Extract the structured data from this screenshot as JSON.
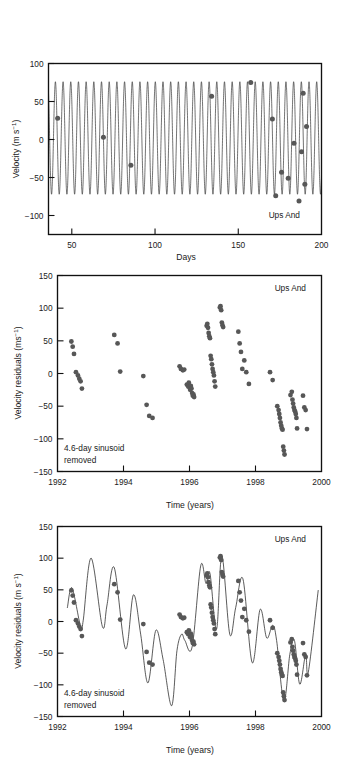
{
  "figure": {
    "object_label": "Ups And",
    "annotation_line1": "4.6-day sinusoid",
    "annotation_line2": "removed",
    "point_color": "#575757",
    "curve_color": "#1b1b1b",
    "axis_color": "#111111"
  },
  "panels": [
    {
      "id": "panel-1",
      "object_label": "Ups And",
      "ylabel_main": "Velocity (m s",
      "ylabel_sup": "−1",
      "ylabel_tail": ")",
      "xlabel": "Days",
      "ytick_labels": [
        "100",
        "50",
        "0",
        "−50",
        "−100"
      ],
      "xtick_labels": [
        "50",
        "100",
        "150",
        "200"
      ]
    },
    {
      "id": "panel-2",
      "object_label": "Ups And",
      "ylabel_main": "Velocity residuals (ms",
      "ylabel_sup": "−1",
      "ylabel_tail": ")",
      "xlabel": "Time (years)",
      "annotation_line1": "4.6-day sinusoid",
      "annotation_line2": "removed",
      "ytick_labels": [
        "150",
        "100",
        "50",
        "0",
        "−50",
        "−100",
        "−150"
      ],
      "xtick_labels": [
        "1992",
        "1994",
        "1996",
        "1998",
        "2000"
      ]
    },
    {
      "id": "panel-3",
      "object_label": "Ups And",
      "ylabel_main": "Velocity residuals (m s",
      "ylabel_sup": "−1",
      "ylabel_tail": ")",
      "xlabel": "Time (years)",
      "annotation_line1": "4.6-day sinusoid",
      "annotation_line2": "removed",
      "ytick_labels": [
        "150",
        "100",
        "50",
        "0",
        "−50",
        "−100",
        "−150"
      ],
      "xtick_labels": [
        "1992",
        "1994",
        "1996",
        "1998",
        "2000"
      ]
    }
  ],
  "chart_data": [
    {
      "type": "line",
      "title": "Ups And",
      "xlabel": "Days",
      "ylabel": "Velocity (m s^-1)",
      "xlim": [
        36,
        200
      ],
      "ylim": [
        -125,
        100
      ],
      "xticks": [
        50,
        100,
        150,
        200
      ],
      "yticks": [
        100,
        50,
        0,
        -50,
        -100
      ],
      "grid": false,
      "legend": false,
      "annotation": "Ups And",
      "model": {
        "name": "4.6-day sinusoid",
        "period_days": 4.617,
        "amplitude": 74,
        "offset": 2,
        "phase_deg": 200
      },
      "series": [
        {
          "name": "Radial velocity measurements",
          "marker": "circle",
          "x": [
            41.5,
            69.0,
            85.5,
            134.0,
            157.5,
            170.5,
            172.5,
            176.0,
            180.0,
            183.5,
            186.5,
            188.0,
            189.0,
            190.0,
            191.0
          ],
          "y": [
            28,
            3,
            -34,
            57,
            75,
            27,
            -74,
            -43,
            -51,
            -5,
            -81,
            -16,
            61,
            -59,
            17
          ]
        }
      ]
    },
    {
      "type": "scatter",
      "title": "Ups And",
      "xlabel": "Time (years)",
      "ylabel": "Velocity residuals (ms^-1)",
      "xlim": [
        1992.0,
        2000.0
      ],
      "ylim": [
        -150,
        150
      ],
      "xticks": [
        1992,
        1994,
        1996,
        1998,
        2000
      ],
      "yticks": [
        150,
        100,
        50,
        0,
        -50,
        -100,
        -150
      ],
      "grid": false,
      "legend": false,
      "annotation": "4.6-day sinusoid removed",
      "series": [
        {
          "name": "Velocity residuals",
          "marker": "circle",
          "x": [
            1992.42,
            1992.46,
            1992.5,
            1992.62,
            1992.66,
            1992.7,
            1992.74,
            1992.56,
            1993.72,
            1993.82,
            1993.9,
            1994.6,
            1994.7,
            1994.78,
            1994.88,
            1995.7,
            1995.74,
            1995.8,
            1995.84,
            1995.92,
            1995.96,
            1995.98,
            1996.0,
            1996.02,
            1996.04,
            1996.06,
            1996.08,
            1996.1,
            1996.12,
            1996.14,
            1996.52,
            1996.54,
            1996.56,
            1996.58,
            1996.6,
            1996.62,
            1996.64,
            1996.66,
            1996.68,
            1996.7,
            1996.72,
            1996.74,
            1996.76,
            1996.78,
            1996.92,
            1996.94,
            1996.96,
            1996.98,
            1997.0,
            1997.02,
            1997.48,
            1997.52,
            1997.56,
            1997.6,
            1997.66,
            1997.72,
            1997.8,
            1998.44,
            1998.52,
            1998.66,
            1998.7,
            1998.72,
            1998.74,
            1998.76,
            1998.78,
            1998.8,
            1998.82,
            1998.84,
            1998.86,
            1998.88,
            1999.06,
            1999.1,
            1999.12,
            1999.14,
            1999.16,
            1999.18,
            1999.2,
            1999.22,
            1999.24,
            1999.26,
            1999.44,
            1999.48,
            1999.52,
            1999.56
          ],
          "y": [
            49,
            41,
            30,
            -3,
            -8,
            -12,
            -23,
            2,
            59,
            46,
            3,
            -4,
            -48,
            -65,
            -68,
            11,
            7,
            5,
            6,
            -17,
            -20,
            -14,
            -21,
            -25,
            -19,
            -23,
            -30,
            -34,
            -32,
            -36,
            73,
            76,
            70,
            62,
            57,
            54,
            27,
            22,
            14,
            7,
            2,
            -3,
            -12,
            -20,
            101,
            103,
            97,
            78,
            74,
            71,
            64,
            46,
            33,
            7,
            20,
            2,
            -16,
            2,
            -10,
            -50,
            -56,
            -62,
            -68,
            -75,
            -80,
            -84,
            -86,
            -112,
            -118,
            -124,
            -33,
            -28,
            -40,
            -46,
            -52,
            -56,
            -58,
            -62,
            -68,
            -84,
            -34,
            -52,
            -56,
            -85
          ]
        }
      ]
    },
    {
      "type": "line",
      "title": "Ups And",
      "xlabel": "Time (years)",
      "ylabel": "Velocity residuals (m s^-1)",
      "xlim": [
        1992.0,
        2000.0
      ],
      "ylim": [
        -150,
        150
      ],
      "xticks": [
        1992,
        1994,
        1996,
        1998,
        2000
      ],
      "yticks": [
        150,
        100,
        50,
        0,
        -50,
        -100,
        -150
      ],
      "grid": false,
      "legend": false,
      "annotation": "4.6-day sinusoid removed",
      "model": {
        "name": "Two-companion Keplerian fit",
        "components": [
          {
            "period_years": 0.66,
            "amplitude": 55,
            "phase_deg": 40
          },
          {
            "period_years": 3.5,
            "amplitude": 48,
            "phase_deg": 150
          }
        ]
      },
      "series": [
        {
          "name": "Velocity residuals",
          "marker": "circle",
          "x": [
            1992.42,
            1992.46,
            1992.5,
            1992.62,
            1992.66,
            1992.7,
            1992.74,
            1992.56,
            1993.72,
            1993.82,
            1993.9,
            1994.6,
            1994.7,
            1994.78,
            1994.88,
            1995.7,
            1995.74,
            1995.8,
            1995.84,
            1995.92,
            1995.96,
            1995.98,
            1996.0,
            1996.02,
            1996.04,
            1996.06,
            1996.08,
            1996.1,
            1996.12,
            1996.14,
            1996.52,
            1996.54,
            1996.56,
            1996.58,
            1996.6,
            1996.62,
            1996.64,
            1996.66,
            1996.68,
            1996.7,
            1996.72,
            1996.74,
            1996.76,
            1996.78,
            1996.92,
            1996.94,
            1996.96,
            1996.98,
            1997.0,
            1997.02,
            1997.48,
            1997.52,
            1997.56,
            1997.6,
            1997.66,
            1997.72,
            1997.8,
            1998.44,
            1998.52,
            1998.66,
            1998.7,
            1998.72,
            1998.74,
            1998.76,
            1998.78,
            1998.8,
            1998.82,
            1998.84,
            1998.86,
            1998.88,
            1999.06,
            1999.1,
            1999.12,
            1999.14,
            1999.16,
            1999.18,
            1999.2,
            1999.22,
            1999.24,
            1999.26,
            1999.44,
            1999.48,
            1999.52,
            1999.56
          ],
          "y": [
            49,
            41,
            30,
            -3,
            -8,
            -12,
            -23,
            2,
            59,
            46,
            3,
            -4,
            -48,
            -65,
            -68,
            11,
            7,
            5,
            6,
            -17,
            -20,
            -14,
            -21,
            -25,
            -19,
            -23,
            -30,
            -34,
            -32,
            -36,
            73,
            76,
            70,
            62,
            57,
            54,
            27,
            22,
            14,
            7,
            2,
            -3,
            -12,
            -20,
            101,
            103,
            97,
            78,
            74,
            71,
            64,
            46,
            33,
            7,
            20,
            2,
            -16,
            2,
            -10,
            -50,
            -56,
            -62,
            -68,
            -75,
            -80,
            -84,
            -86,
            -112,
            -118,
            -124,
            -33,
            -28,
            -40,
            -46,
            -52,
            -56,
            -58,
            -62,
            -68,
            -84,
            -34,
            -52,
            -56,
            -85
          ]
        }
      ]
    }
  ]
}
